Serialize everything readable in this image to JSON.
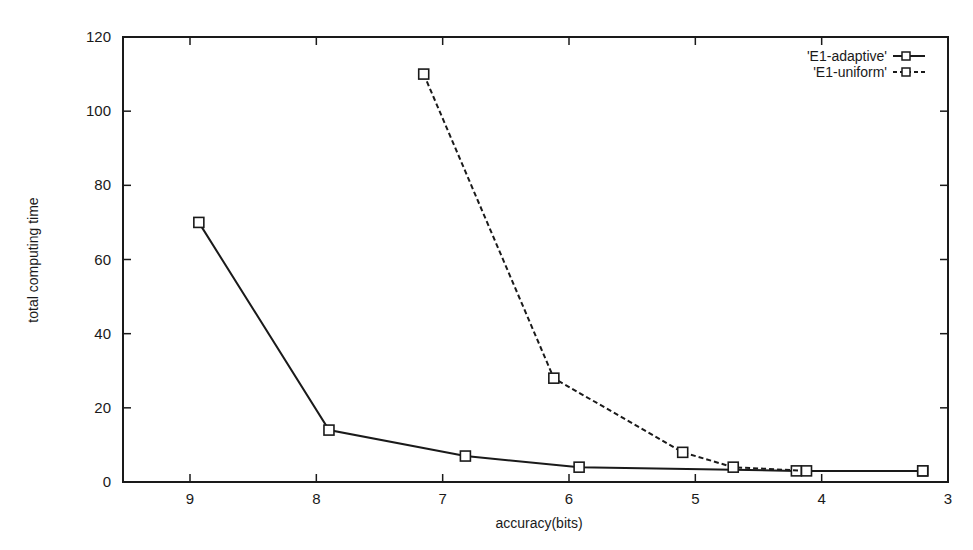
{
  "chart_data": {
    "type": "line",
    "title": "",
    "xlabel": "accuracy(bits)",
    "ylabel": "total computing time",
    "xlim": [
      9.45,
      3
    ],
    "ylim": [
      0,
      120
    ],
    "x_reversed": true,
    "xticks": [
      9,
      8,
      7,
      6,
      5,
      4,
      3
    ],
    "yticks": [
      0,
      20,
      40,
      60,
      80,
      100,
      120
    ],
    "grid": false,
    "legend_position": "top-right",
    "series": [
      {
        "name": "'E1-adaptive'",
        "line_style": "solid",
        "marker": "square",
        "x": [
          8.93,
          7.9,
          6.82,
          5.92,
          4.2,
          3.2
        ],
        "y": [
          70,
          14,
          7,
          4,
          3,
          3
        ]
      },
      {
        "name": "'E1-uniform'",
        "line_style": "dashed",
        "marker": "square",
        "x": [
          7.15,
          6.12,
          5.1,
          4.7,
          4.12,
          3.2
        ],
        "y": [
          110,
          28,
          8,
          4,
          3,
          3
        ]
      }
    ]
  },
  "colors": {
    "ink": "#1a1a1a",
    "background": "#ffffff"
  }
}
